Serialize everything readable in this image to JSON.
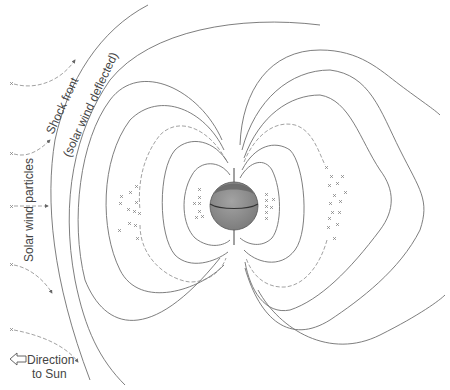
{
  "diagram": {
    "labels": {
      "shock_front": "Shock front",
      "shock_front_sub": "(solar wind deflected)",
      "solar_wind_particles": "Solar wind particles",
      "direction_line1": "Direction",
      "direction_line2": "to Sun"
    },
    "icons": {
      "direction_arrow": "hollow-left-arrow",
      "planet": "earth-sphere",
      "particle": "x-mark"
    },
    "colors": {
      "line": "#6f6f6f",
      "earth_fill": "#8c8c8c",
      "earth_cap": "#6e6e6e",
      "text": "#444444",
      "background": "#ffffff"
    }
  }
}
